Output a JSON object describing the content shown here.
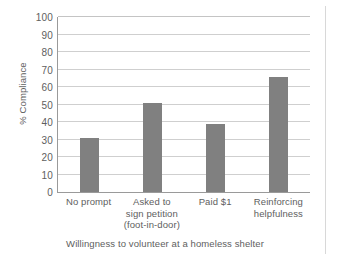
{
  "chart_data": {
    "type": "bar",
    "title": "",
    "subtitle": "",
    "categories": [
      "No prompt",
      "Asked to sign petition (foot-in-door)",
      "Paid $1",
      "Reinforcing helpfulness"
    ],
    "category_lines": [
      [
        "No prompt"
      ],
      [
        "Asked to",
        "sign petition",
        "(foot-in-door)"
      ],
      [
        "Paid $1"
      ],
      [
        "Reinforcing",
        "helpfulness"
      ]
    ],
    "values": [
      31,
      51,
      39,
      66
    ],
    "xlabel": "Willingness to volunteer at a homeless shelter",
    "ylabel": "% Compliance",
    "ylim": [
      0,
      100
    ],
    "ytick_step": 10,
    "yticks": [
      0,
      10,
      20,
      30,
      40,
      50,
      60,
      70,
      80,
      90,
      100
    ],
    "ytick_labels": [
      "0",
      "10",
      "20",
      "30",
      "40",
      "50",
      "60",
      "70",
      "80",
      "90",
      "100"
    ],
    "grid": true,
    "grid_axis": "y",
    "legend": false,
    "legend_position": "none",
    "bar_color": "#808080",
    "grid_color": "#cfcfcf",
    "axis_color": "#9a9a9a",
    "text_color": "#5e5e5e",
    "background_color": "#ffffff"
  },
  "figure": {
    "caption": "Willingness to volunteer at a homeless shelter",
    "y_axis_title": "% Compliance"
  }
}
